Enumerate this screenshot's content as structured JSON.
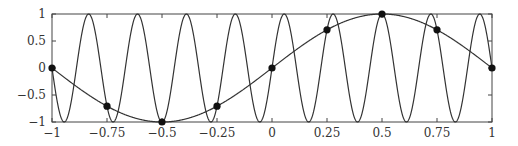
{
  "chart_data": {
    "type": "line",
    "title": "",
    "xlabel": "",
    "ylabel": "",
    "xlim": [
      -1,
      1
    ],
    "ylim": [
      -1,
      1
    ],
    "grid": false,
    "legend": null,
    "x_ticks": [
      -1,
      -0.75,
      -0.5,
      -0.25,
      0,
      0.25,
      0.5,
      0.75,
      1
    ],
    "x_tick_labels": [
      "−1",
      "−0.75",
      "−0.5",
      "−0.25",
      "0",
      "0.25",
      "0.5",
      "0.75",
      "1"
    ],
    "y_ticks": [
      -1,
      -0.5,
      0,
      0.5,
      1
    ],
    "y_tick_labels": [
      "−1",
      "−0.5",
      "0",
      "0.5",
      "1"
    ],
    "series": [
      {
        "name": "sin(9πx)",
        "kind": "curve",
        "frequency": 9,
        "description": "high-frequency sinusoid, 9 periods over [-1,1]",
        "color": "#333333"
      },
      {
        "name": "sin(πx)",
        "kind": "curve",
        "frequency": 1,
        "description": "low-frequency sinusoid (alias)",
        "color": "#333333"
      },
      {
        "name": "samples",
        "kind": "markers",
        "x": [
          -1,
          -0.75,
          -0.5,
          -0.25,
          0,
          0.25,
          0.5,
          0.75,
          1
        ],
        "y": [
          0,
          -0.707,
          -1,
          -0.707,
          0,
          0.707,
          1,
          0.707,
          0
        ],
        "color": "#111111"
      }
    ]
  },
  "layout": {
    "plot_left": 52,
    "plot_right": 492,
    "plot_top": 14,
    "plot_bottom": 122
  }
}
